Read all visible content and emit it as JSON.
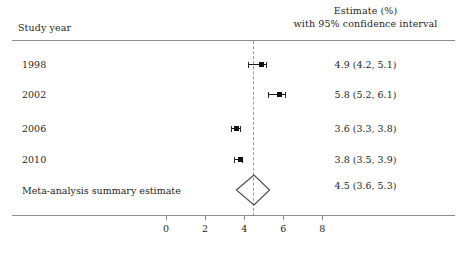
{
  "header": {
    "study_year_label": "Study year",
    "estimate_label_line1": "Estimate (%)",
    "estimate_label_line2": "with 95% confidence interval"
  },
  "chart_data": {
    "type": "forest",
    "title": "",
    "xlabel": "",
    "ylabel": "",
    "xlim": [
      -1.5,
      9.0
    ],
    "grid": false,
    "reference_line": 4.5,
    "categories": [
      "1998",
      "2002",
      "2006",
      "2010",
      "Meta-analysis summary estimate"
    ],
    "rows": [
      {
        "label": "1998",
        "estimate": 4.9,
        "ci_low": 4.2,
        "ci_high": 5.1,
        "estimate_text": "4.9 (4.2, 5.1)",
        "marker": "square"
      },
      {
        "label": "2002",
        "estimate": 5.8,
        "ci_low": 5.2,
        "ci_high": 6.1,
        "estimate_text": "5.8 (5.2, 6.1)",
        "marker": "square"
      },
      {
        "label": "2006",
        "estimate": 3.6,
        "ci_low": 3.3,
        "ci_high": 3.8,
        "estimate_text": "3.6 (3.3, 3.8)",
        "marker": "square"
      },
      {
        "label": "2010",
        "estimate": 3.8,
        "ci_low": 3.5,
        "ci_high": 3.9,
        "estimate_text": "3.8 (3.5, 3.9)",
        "marker": "square"
      }
    ],
    "summary": {
      "label": "Meta-analysis summary estimate",
      "estimate": 4.5,
      "ci_low": 3.6,
      "ci_high": 5.3,
      "estimate_text": "4.5 (3.6, 5.3)",
      "marker": "diamond"
    },
    "x_ticks": [
      0,
      2,
      4,
      6,
      8
    ],
    "x_tick_labels": [
      "0",
      "2",
      "4",
      "6",
      "8"
    ]
  },
  "colors": {
    "marker": "#111111",
    "ci_line": "#1a1a1a",
    "diamond_stroke": "#4a4a4a",
    "reference_line": "#9a9a9a",
    "rule": "#8d8d8d",
    "text": "#1f1f1f",
    "background": "#ffffff"
  }
}
